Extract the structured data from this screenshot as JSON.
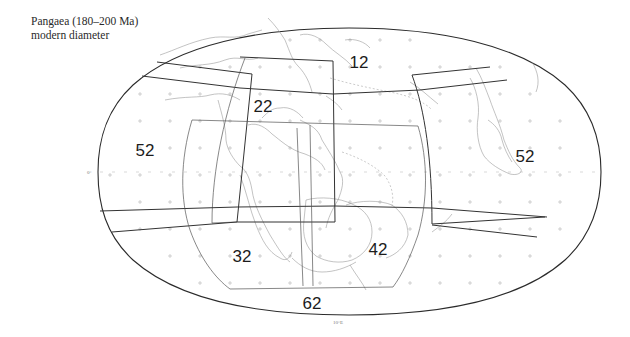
{
  "caption": {
    "line1": "Pangaea (180–200 Ma)",
    "line2": "modern diameter"
  },
  "map": {
    "projection": "elliptical world map (Pangaea reconstruction)",
    "axis_labels": {
      "equator": "0°",
      "meridian": "10°E"
    },
    "zones": [
      {
        "id": "zone-12",
        "label": "12",
        "x": 359,
        "y": 68
      },
      {
        "id": "zone-22",
        "label": "22",
        "x": 263,
        "y": 112
      },
      {
        "id": "zone-52-left",
        "label": "52",
        "x": 145,
        "y": 156
      },
      {
        "id": "zone-52-right",
        "label": "52",
        "x": 525,
        "y": 162
      },
      {
        "id": "zone-32",
        "label": "32",
        "x": 242,
        "y": 262
      },
      {
        "id": "zone-42",
        "label": "42",
        "x": 378,
        "y": 255
      },
      {
        "id": "zone-62",
        "label": "62",
        "x": 312,
        "y": 309
      }
    ],
    "colors": {
      "outline": "#2b2b2b",
      "coastline": "#9a9a9a",
      "grid": "#b5b5b5",
      "text": "#1c1c1c"
    }
  }
}
